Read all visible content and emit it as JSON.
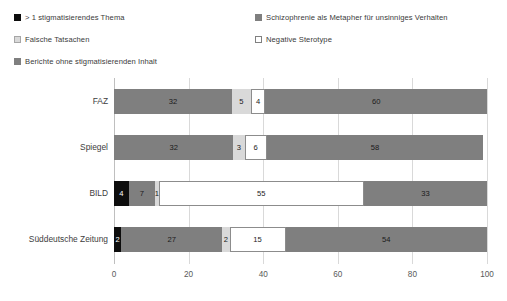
{
  "chart_data": {
    "type": "bar",
    "orientation": "horizontal",
    "stacked": true,
    "stacked_percent": true,
    "title": "",
    "subtitle": "",
    "xlabel": "",
    "ylabel": "",
    "xlim": [
      0,
      100
    ],
    "xticks": [
      0,
      20,
      40,
      60,
      80,
      100
    ],
    "grid": true,
    "legend_position": "top",
    "categories": [
      "FAZ",
      "Spiegel",
      "BILD",
      "Süddeutsche Zeitung"
    ],
    "series": [
      {
        "name": "> 1 stigmatisierendes Thema",
        "color": "#0d0d0d",
        "text_color": "#ffffff",
        "values": [
          0,
          0,
          4,
          2
        ]
      },
      {
        "name": "Schizophrenie als Metapher für unsinniges Verhalten",
        "color": "#7f7f7f",
        "text_color": "#1a1a1a",
        "values": [
          32,
          32,
          7,
          27
        ]
      },
      {
        "name": "Falsche Tatsachen",
        "color": "#d9d9d9",
        "text_color": "#1a1a1a",
        "values": [
          5,
          3,
          1,
          2
        ]
      },
      {
        "name": "Negative Sterotype",
        "color": "#ffffff",
        "text_color": "#1a1a1a",
        "values": [
          4,
          6,
          55,
          15
        ]
      },
      {
        "name": "Berichte ohne stigmatisierenden Inhalt",
        "color": "#7f7f7f",
        "text_color": "#1a1a1a",
        "values": [
          60,
          58,
          33,
          54
        ]
      }
    ],
    "legend": [
      {
        "label": "> 1 stigmatisierendes Thema",
        "color": "#0d0d0d",
        "border": "#0d0d0d"
      },
      {
        "label": "Schizophrenie als Metapher für unsinniges Verhalten",
        "color": "#7f7f7f",
        "border": "#7f7f7f"
      },
      {
        "label": "Falsche Tatsachen",
        "color": "#d9d9d9",
        "border": "#a6a6a6"
      },
      {
        "label": "Negative Sterotype",
        "color": "#ffffff",
        "border": "#808080"
      },
      {
        "label": "Berichte ohne stigmatisierenden Inhalt",
        "color": "#7f7f7f",
        "border": "#7f7f7f"
      }
    ],
    "bars": [
      {
        "category": "FAZ",
        "segments": [
          {
            "series": "> 1 stigmatisierendes Thema",
            "value": 0,
            "label": ""
          },
          {
            "series": "Schizophrenie als Metapher für unsinniges Verhalten",
            "value": 32,
            "label": "32"
          },
          {
            "series": "Falsche Tatsachen",
            "value": 5,
            "label": "5"
          },
          {
            "series": "Negative Sterotype",
            "value": 4,
            "label": "4"
          },
          {
            "series": "Berichte ohne stigmatisierenden Inhalt",
            "value": 60,
            "label": "60"
          }
        ]
      },
      {
        "category": "Spiegel",
        "segments": [
          {
            "series": "> 1 stigmatisierendes Thema",
            "value": 0,
            "label": ""
          },
          {
            "series": "Schizophrenie als Metapher für unsinniges Verhalten",
            "value": 32,
            "label": "32"
          },
          {
            "series": "Falsche Tatsachen",
            "value": 3,
            "label": "3"
          },
          {
            "series": "Negative Sterotype",
            "value": 6,
            "label": "6"
          },
          {
            "series": "Berichte ohne stigmatisierenden Inhalt",
            "value": 58,
            "label": "58"
          }
        ]
      },
      {
        "category": "BILD",
        "segments": [
          {
            "series": "> 1 stigmatisierendes Thema",
            "value": 4,
            "label": "4"
          },
          {
            "series": "Schizophrenie als Metapher für unsinniges Verhalten",
            "value": 7,
            "label": "7"
          },
          {
            "series": "Falsche Tatsachen",
            "value": 1,
            "label": "1"
          },
          {
            "series": "Negative Sterotype",
            "value": 55,
            "label": "55"
          },
          {
            "series": "Berichte ohne stigmatisierenden Inhalt",
            "value": 33,
            "label": "33"
          }
        ]
      },
      {
        "category": "Süddeutsche Zeitung",
        "segments": [
          {
            "series": "> 1 stigmatisierendes Thema",
            "value": 2,
            "label": "2"
          },
          {
            "series": "Schizophrenie als Metapher für unsinniges Verhalten",
            "value": 27,
            "label": "27"
          },
          {
            "series": "Falsche Tatsachen",
            "value": 2,
            "label": "2"
          },
          {
            "series": "Negative Sterotype",
            "value": 15,
            "label": "15"
          },
          {
            "series": "Berichte ohne stigmatisierenden Inhalt",
            "value": 54,
            "label": "54"
          }
        ]
      }
    ]
  }
}
